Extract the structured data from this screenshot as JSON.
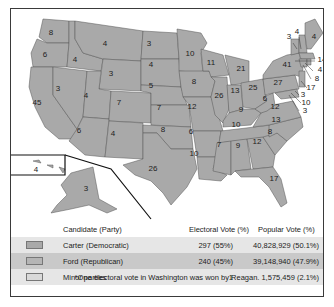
{
  "map": {
    "title": "1976 Presidential Election",
    "fill_color": "#a9a9a9",
    "state_labels": [
      {
        "state": "WA",
        "ev": "8"
      },
      {
        "state": "OR",
        "ev": "6"
      },
      {
        "state": "CA",
        "ev": "45"
      },
      {
        "state": "ID",
        "ev": "4"
      },
      {
        "state": "NV",
        "ev": "3"
      },
      {
        "state": "MT",
        "ev": "4"
      },
      {
        "state": "WY",
        "ev": "3"
      },
      {
        "state": "UT",
        "ev": "4"
      },
      {
        "state": "AZ",
        "ev": "6"
      },
      {
        "state": "CO",
        "ev": "7"
      },
      {
        "state": "NM",
        "ev": "4"
      },
      {
        "state": "ND",
        "ev": "3"
      },
      {
        "state": "SD",
        "ev": "4"
      },
      {
        "state": "NE",
        "ev": "5"
      },
      {
        "state": "KS",
        "ev": "7"
      },
      {
        "state": "OK",
        "ev": "8"
      },
      {
        "state": "TX",
        "ev": "26"
      },
      {
        "state": "MN",
        "ev": "10"
      },
      {
        "state": "IA",
        "ev": "8"
      },
      {
        "state": "MO",
        "ev": "12"
      },
      {
        "state": "AR",
        "ev": "6"
      },
      {
        "state": "LA",
        "ev": "10"
      },
      {
        "state": "WI",
        "ev": "11"
      },
      {
        "state": "IL",
        "ev": "26"
      },
      {
        "state": "MI",
        "ev": "21"
      },
      {
        "state": "IN",
        "ev": "13"
      },
      {
        "state": "OH",
        "ev": "25"
      },
      {
        "state": "KY",
        "ev": "9"
      },
      {
        "state": "TN",
        "ev": "10"
      },
      {
        "state": "MS",
        "ev": "7"
      },
      {
        "state": "AL",
        "ev": "9"
      },
      {
        "state": "GA",
        "ev": "12"
      },
      {
        "state": "FL",
        "ev": "17"
      },
      {
        "state": "SC",
        "ev": "8"
      },
      {
        "state": "NC",
        "ev": "13"
      },
      {
        "state": "VA",
        "ev": "12"
      },
      {
        "state": "WV",
        "ev": "6"
      },
      {
        "state": "PA",
        "ev": "27"
      },
      {
        "state": "NY",
        "ev": "41"
      },
      {
        "state": "VT",
        "ev": "3"
      },
      {
        "state": "NH",
        "ev": "4"
      },
      {
        "state": "ME",
        "ev": "4"
      },
      {
        "state": "MA",
        "ev": "14"
      },
      {
        "state": "RI",
        "ev": "4"
      },
      {
        "state": "CT",
        "ev": "8"
      },
      {
        "state": "NJ",
        "ev": "17"
      },
      {
        "state": "DE",
        "ev": "3"
      },
      {
        "state": "MD",
        "ev": "10"
      },
      {
        "state": "DC",
        "ev": "3"
      },
      {
        "state": "HI",
        "ev": "4"
      },
      {
        "state": "AK",
        "ev": "3"
      }
    ]
  },
  "legend": {
    "headers": {
      "candidate": "Candidate (Party)",
      "electoral": "Electoral Vote (%)",
      "popular": "Popular Vote (%)"
    },
    "rows": [
      {
        "candidate": "Carter (Democratic)",
        "electoral": "297 (55%)",
        "popular": "40,828,929 (50.1%)",
        "swatch": "#a9a9a9",
        "row_bg": "#e6e6e6"
      },
      {
        "candidate": "Ford (Republican)",
        "electoral": "240 (45%)",
        "popular": "39,148,940 (47.9%)",
        "swatch": "#b5b5b5",
        "row_bg": "#c9c9c9"
      },
      {
        "candidate": "Minor parties",
        "electoral": "1",
        "popular": "1,575,459 (2.1%)",
        "swatch": "#d9d9d9",
        "row_bg": "#e6e6e6"
      }
    ],
    "footnote": "*One electoral vote in Washington was won by Reagan."
  }
}
